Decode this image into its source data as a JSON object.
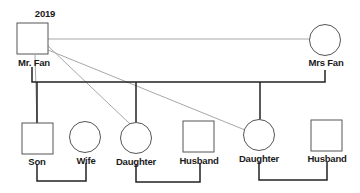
{
  "diagram": {
    "type": "family-tree",
    "year_label": "2019",
    "people": [
      {
        "id": "mr_fan",
        "name": "Mr. Fan",
        "shape": "square",
        "generation": 1
      },
      {
        "id": "mrs_fan",
        "name": "Mrs Fan",
        "shape": "circle",
        "generation": 1
      },
      {
        "id": "son",
        "name": "Son",
        "shape": "square",
        "generation": 2
      },
      {
        "id": "wife",
        "name": "Wife",
        "shape": "circle",
        "generation": 2
      },
      {
        "id": "daughter1",
        "name": "Daughter",
        "shape": "circle",
        "generation": 2
      },
      {
        "id": "husband1",
        "name": "Husband",
        "shape": "square",
        "generation": 2
      },
      {
        "id": "daughter2",
        "name": "Daughter",
        "shape": "circle",
        "generation": 2
      },
      {
        "id": "husband2",
        "name": "Husband",
        "shape": "square",
        "generation": 2
      }
    ],
    "relations": [
      {
        "from": "mr_fan",
        "to": "mrs_fan",
        "type": "marriage"
      },
      {
        "from": "son",
        "to": "wife",
        "type": "marriage"
      },
      {
        "from": "daughter1",
        "to": "husband1",
        "type": "marriage"
      },
      {
        "from": "daughter2",
        "to": "husband2",
        "type": "marriage"
      },
      {
        "from": "mr_fan",
        "to": "son",
        "type": "parent-child"
      },
      {
        "from": "mr_fan",
        "to": "daughter1",
        "type": "parent-child"
      },
      {
        "from": "mr_fan",
        "to": "daughter2",
        "type": "parent-child"
      }
    ],
    "colors": {
      "primary_line": "#222222",
      "secondary_line": "#a8a8a8",
      "shape_stroke": "#555555"
    }
  }
}
